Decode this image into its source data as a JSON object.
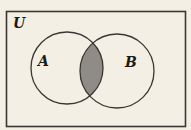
{
  "diagram": {
    "type": "venn",
    "universe_label": "U",
    "sets": [
      {
        "label": "A",
        "cx": 67,
        "cy": 68,
        "r": 36,
        "label_x": 38,
        "label_y": 66
      },
      {
        "label": "B",
        "cx": 117,
        "cy": 71,
        "r": 37,
        "label_x": 125,
        "label_y": 67
      }
    ],
    "shaded_region": "A ∩ B",
    "colors": {
      "background": "#f4efe4",
      "stroke": "#3a3632",
      "shade": "#8f8b86"
    }
  }
}
